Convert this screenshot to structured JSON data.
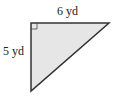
{
  "diagram": {
    "shape": "right-triangle",
    "fill": "#e6e6e6",
    "stroke": "#333333",
    "labels": {
      "top": "6 yd",
      "left": "5 yd"
    },
    "right_angle_marker": true
  }
}
